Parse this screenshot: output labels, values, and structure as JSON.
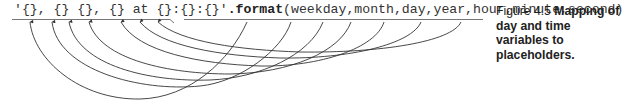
{
  "code": {
    "format_string": "'{}, {} {}, {} at {}:{}:{}'",
    "method": ".format",
    "open_paren": "(",
    "args_text": "weekday,month,day,year,hour,minute,second",
    "close_paren": ")",
    "arguments": [
      "weekday",
      "month",
      "day",
      "year",
      "hour",
      "minute",
      "second"
    ],
    "placeholders": [
      "{}",
      "{}",
      "{}",
      "{}",
      "{}",
      "{}",
      "{}"
    ]
  },
  "caption": {
    "label": "Figure 4.5",
    "text": "Mapping of day and time variables to placeholders."
  },
  "mappings": [
    {
      "argument": "weekday",
      "placeholder_index": 0
    },
    {
      "argument": "month",
      "placeholder_index": 1
    },
    {
      "argument": "day",
      "placeholder_index": 2
    },
    {
      "argument": "year",
      "placeholder_index": 3
    },
    {
      "argument": "hour",
      "placeholder_index": 4
    },
    {
      "argument": "minute",
      "placeholder_index": 5
    },
    {
      "argument": "second",
      "placeholder_index": 6
    }
  ],
  "colors": {
    "line": "#333333",
    "text": "#333333",
    "underline": "#777777"
  }
}
